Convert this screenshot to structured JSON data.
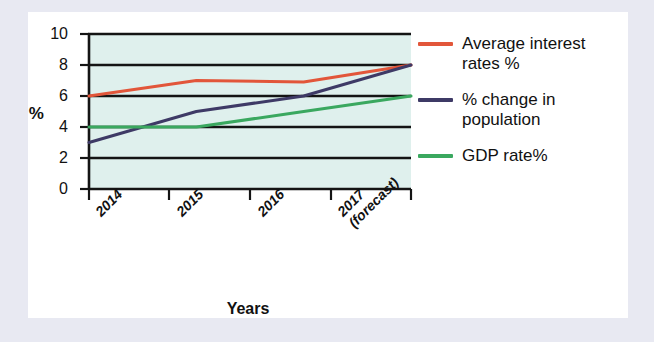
{
  "chart_data": {
    "type": "line",
    "title": "",
    "xlabel": "Years",
    "ylabel": "%",
    "ylim": [
      0,
      10
    ],
    "yticks": [
      0,
      2,
      4,
      6,
      8,
      10
    ],
    "grid": true,
    "legend_position": "right",
    "plot_background": "#dff0ed",
    "categories": [
      "2014",
      "2015",
      "2016",
      "2017 (forecast)"
    ],
    "x_tick_labels": [
      {
        "line1": "2014",
        "line2": ""
      },
      {
        "line1": "2015",
        "line2": ""
      },
      {
        "line1": "2016",
        "line2": ""
      },
      {
        "line1": "2017",
        "line2": "(forecast)"
      }
    ],
    "series": [
      {
        "name": "Average interest rates %",
        "color": "#e2563a",
        "values": [
          6.0,
          7.0,
          6.9,
          8.0
        ]
      },
      {
        "name": "% change in population",
        "color": "#3e3a66",
        "values": [
          3.0,
          5.0,
          6.0,
          8.0
        ]
      },
      {
        "name": "GDP rate%",
        "color": "#3aa85f",
        "values": [
          4.0,
          4.0,
          5.0,
          6.0
        ]
      }
    ]
  },
  "legend": {
    "items": [
      {
        "label": "Average interest rates %",
        "color": "#e2563a"
      },
      {
        "label": "% change in population",
        "color": "#3e3a66"
      },
      {
        "label": "GDP rate%",
        "color": "#3aa85f"
      }
    ]
  },
  "axes": {
    "y_title": "%",
    "x_title": "Years",
    "y_tick_labels": [
      "10",
      "8",
      "6",
      "4",
      "2",
      "0"
    ]
  }
}
